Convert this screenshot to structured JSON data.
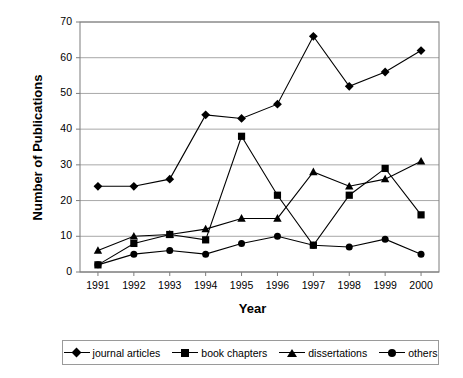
{
  "chart_data": {
    "type": "line",
    "title": "",
    "xlabel": "Year",
    "ylabel": "Number of Publications",
    "categories": [
      "1991",
      "1992",
      "1993",
      "1994",
      "1995",
      "1996",
      "1997",
      "1998",
      "1999",
      "2000"
    ],
    "x": [
      1991,
      1992,
      1993,
      1994,
      1995,
      1996,
      1997,
      1998,
      1999,
      2000
    ],
    "ylim": [
      0,
      70
    ],
    "yticks": [
      0,
      10,
      20,
      30,
      40,
      50,
      60,
      70
    ],
    "ytick_labels": [
      "0",
      "10",
      "20",
      "30",
      "40",
      "50",
      "60",
      "70"
    ],
    "grid": "horizontal",
    "legend_position": "bottom",
    "series": [
      {
        "name": "journal articles",
        "marker": "diamond",
        "color": "#000000",
        "values": [
          24,
          24,
          26,
          44,
          43,
          47,
          66,
          52,
          56,
          62
        ]
      },
      {
        "name": "book chapters",
        "marker": "square",
        "color": "#000000",
        "values": [
          2,
          8,
          10.5,
          9,
          38,
          21.5,
          7.5,
          21.5,
          29,
          16
        ]
      },
      {
        "name": "dissertations",
        "marker": "triangle",
        "color": "#000000",
        "values": [
          6,
          10,
          10.5,
          12,
          15,
          15,
          28,
          24,
          26,
          31
        ]
      },
      {
        "name": "others",
        "marker": "circle",
        "color": "#000000",
        "values": [
          2,
          5,
          6,
          5,
          8,
          10,
          7.5,
          7,
          9.2,
          5
        ]
      }
    ]
  },
  "legend": {
    "items": [
      {
        "label": "journal articles",
        "marker": "diamond"
      },
      {
        "label": "book chapters",
        "marker": "square"
      },
      {
        "label": "dissertations",
        "marker": "triangle"
      },
      {
        "label": "others",
        "marker": "circle"
      }
    ]
  },
  "axes": {
    "y_title": "Number of Publications",
    "x_title": "Year"
  },
  "colors": {
    "plot_border": "#7d7d7d",
    "gridline": "#a8a8a8",
    "series": "#000000",
    "legend_border": "#9a9a9a",
    "background": "#ffffff"
  }
}
